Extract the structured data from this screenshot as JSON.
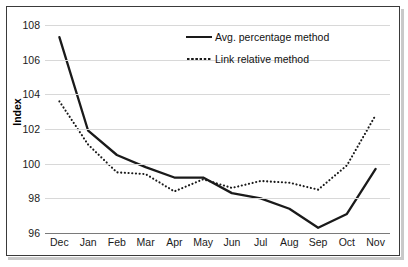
{
  "chart_data": {
    "type": "line",
    "title": "",
    "xlabel": "",
    "ylabel": "Index",
    "categories": [
      "Dec",
      "Jan",
      "Feb",
      "Mar",
      "Apr",
      "May",
      "Jun",
      "Jul",
      "Aug",
      "Sep",
      "Oct",
      "Nov"
    ],
    "ylim": [
      96,
      108
    ],
    "yticks": [
      96,
      98,
      100,
      102,
      104,
      106,
      108
    ],
    "grid": true,
    "legend_position": "top-right",
    "series": [
      {
        "name": "Avg. percentage method",
        "style": "solid",
        "color": "#1a1a1a",
        "values": [
          107.3,
          101.9,
          100.5,
          99.8,
          99.2,
          99.2,
          98.3,
          98.0,
          97.4,
          96.3,
          97.1,
          99.7
        ]
      },
      {
        "name": "Link relative method",
        "style": "dotted",
        "color": "#1a1a1a",
        "values": [
          103.6,
          101.1,
          99.5,
          99.4,
          98.4,
          99.1,
          98.6,
          99.0,
          98.9,
          98.5,
          99.9,
          102.8
        ]
      }
    ]
  },
  "legend": {
    "items": [
      {
        "label": "Avg. percentage method",
        "style": "solid"
      },
      {
        "label": "Link relative method",
        "style": "dotted"
      }
    ]
  },
  "axis": {
    "y_title": "Index",
    "y_tick_labels": [
      "108",
      "106",
      "104",
      "102",
      "100",
      "98",
      "96"
    ],
    "x_tick_labels": [
      "Dec",
      "Jan",
      "Feb",
      "Mar",
      "Apr",
      "May",
      "Jun",
      "Jul",
      "Aug",
      "Sep",
      "Oct",
      "Nov"
    ]
  }
}
